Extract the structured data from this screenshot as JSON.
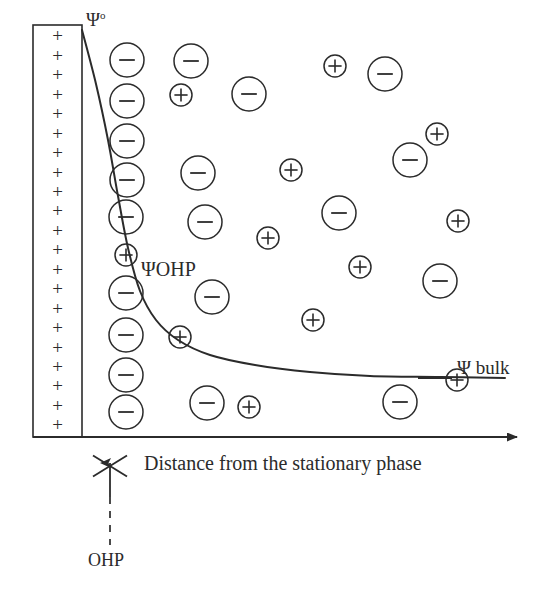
{
  "diagram": {
    "stroke_color": "#2b2b2b",
    "background": "#ffffff",
    "labels": {
      "psi_zero": "Ψ",
      "psi_zero_superscript": "o",
      "psi_ohp": "ΨOHP",
      "psi_bulk": "Ψ bulk",
      "axis_x": "Distance from the stationary phase",
      "ohp_marker": "OHP"
    },
    "stationary_phase": {
      "name": "stationary-phase-wall",
      "x": 33,
      "y": 25,
      "width": 49,
      "height": 412,
      "charge_symbol": "+",
      "charge_count": 21
    },
    "axis": {
      "x_start": 33,
      "x_end": 517,
      "y": 437,
      "arrow": true
    },
    "ohp_pointer": {
      "cross_center_x": 110,
      "cross_center_y": 466,
      "cross_size": 17,
      "arrow_from_y": 497,
      "arrow_to_y": 463,
      "dash_from_y": 497,
      "dash_to_y": 545
    },
    "potential_curve": {
      "type": "exponential-decay",
      "description": "Potential decays from Psi-zero at the wall to Psi-bulk in solution",
      "start": [
        82,
        30
      ],
      "end": [
        505,
        378
      ],
      "points": [
        [
          82,
          30
        ],
        [
          96,
          84
        ],
        [
          108,
          140
        ],
        [
          118,
          196
        ],
        [
          128,
          248
        ],
        [
          140,
          291
        ],
        [
          156,
          320
        ],
        [
          178,
          340
        ],
        [
          210,
          355
        ],
        [
          255,
          365
        ],
        [
          310,
          372
        ],
        [
          370,
          376
        ],
        [
          440,
          377
        ],
        [
          505,
          378
        ]
      ]
    },
    "bulk_level_line": {
      "x_start": 418,
      "x_end": 452,
      "y": 378
    },
    "ions": {
      "negative_symbol": "−",
      "positive_symbol": "+",
      "negative_radius": 17,
      "positive_radius": 11,
      "items": [
        {
          "charge": "negative",
          "cx": 127,
          "cy": 60
        },
        {
          "charge": "negative",
          "cx": 127,
          "cy": 101
        },
        {
          "charge": "negative",
          "cx": 127,
          "cy": 141
        },
        {
          "charge": "negative",
          "cx": 127,
          "cy": 180
        },
        {
          "charge": "negative",
          "cx": 126,
          "cy": 217
        },
        {
          "charge": "positive",
          "cx": 126,
          "cy": 255
        },
        {
          "charge": "negative",
          "cx": 126,
          "cy": 293
        },
        {
          "charge": "negative",
          "cx": 126,
          "cy": 335
        },
        {
          "charge": "negative",
          "cx": 126,
          "cy": 375
        },
        {
          "charge": "negative",
          "cx": 126,
          "cy": 412
        },
        {
          "charge": "negative",
          "cx": 191,
          "cy": 61
        },
        {
          "charge": "positive",
          "cx": 181,
          "cy": 95
        },
        {
          "charge": "negative",
          "cx": 249,
          "cy": 94
        },
        {
          "charge": "positive",
          "cx": 291,
          "cy": 170
        },
        {
          "charge": "negative",
          "cx": 198,
          "cy": 173
        },
        {
          "charge": "negative",
          "cx": 205,
          "cy": 222
        },
        {
          "charge": "positive",
          "cx": 268,
          "cy": 238
        },
        {
          "charge": "negative",
          "cx": 212,
          "cy": 297
        },
        {
          "charge": "positive",
          "cx": 313,
          "cy": 320
        },
        {
          "charge": "positive",
          "cx": 180,
          "cy": 337
        },
        {
          "charge": "negative",
          "cx": 207,
          "cy": 403
        },
        {
          "charge": "positive",
          "cx": 249,
          "cy": 407
        },
        {
          "charge": "positive",
          "cx": 335,
          "cy": 66
        },
        {
          "charge": "negative",
          "cx": 385,
          "cy": 74
        },
        {
          "charge": "positive",
          "cx": 437,
          "cy": 134
        },
        {
          "charge": "negative",
          "cx": 410,
          "cy": 160
        },
        {
          "charge": "negative",
          "cx": 339,
          "cy": 213
        },
        {
          "charge": "positive",
          "cx": 458,
          "cy": 221
        },
        {
          "charge": "positive",
          "cx": 360,
          "cy": 267
        },
        {
          "charge": "negative",
          "cx": 440,
          "cy": 281
        },
        {
          "charge": "negative",
          "cx": 400,
          "cy": 402
        },
        {
          "charge": "positive",
          "cx": 457,
          "cy": 380
        }
      ]
    }
  }
}
